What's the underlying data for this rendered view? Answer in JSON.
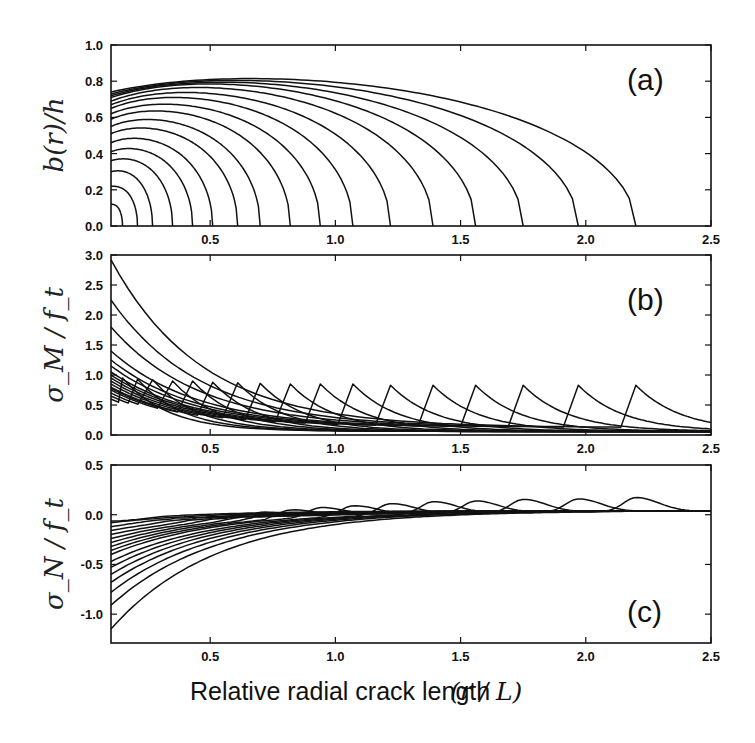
{
  "figure": {
    "xlabel": "Relative radial crack length",
    "xlabel_math": "(r / L)"
  },
  "chart_data": [
    {
      "id": "a",
      "type": "line",
      "panel_label": "(a)",
      "title": "",
      "xlabel": "Relative radial crack length (r/L)",
      "ylabel": "b(r)/h",
      "xlim": [
        0.104,
        2.5
      ],
      "ylim": [
        0.0,
        1.0
      ],
      "xticks": [
        0.5,
        1.0,
        1.5,
        2.0,
        2.5
      ],
      "yticks": [
        0.0,
        0.2,
        0.4,
        0.6,
        0.8,
        1.0
      ],
      "ytick_labels": [
        "0.0",
        "0.2",
        "0.4",
        "0.6",
        "0.8",
        "1.0"
      ],
      "grid": false,
      "legend": "none",
      "description": "Crack depth profiles b(r)/h for 17 successive radial crack lengths; each curve drops to zero at its crack tip.",
      "crack_tips": [
        0.15,
        0.21,
        0.27,
        0.35,
        0.43,
        0.51,
        0.61,
        0.7,
        0.82,
        0.94,
        1.07,
        1.22,
        1.39,
        1.56,
        1.75,
        1.97,
        2.2
      ],
      "start_values": [
        0.12,
        0.22,
        0.3,
        0.36,
        0.41,
        0.46,
        0.51,
        0.55,
        0.59,
        0.62,
        0.65,
        0.67,
        0.69,
        0.71,
        0.72,
        0.73,
        0.74
      ],
      "plateau_values": [
        0.12,
        0.22,
        0.31,
        0.38,
        0.44,
        0.5,
        0.56,
        0.61,
        0.66,
        0.7,
        0.74,
        0.77,
        0.8,
        0.82,
        0.83,
        0.84,
        0.85
      ]
    },
    {
      "id": "b",
      "type": "line",
      "panel_label": "(b)",
      "title": "",
      "xlabel": "Relative radial crack length (r/L)",
      "ylabel": "σ_M / f_t",
      "xlim": [
        0.104,
        2.5
      ],
      "ylim": [
        0.0,
        3.0
      ],
      "xticks": [
        0.5,
        1.0,
        1.5,
        2.0,
        2.5
      ],
      "yticks": [
        0.0,
        0.5,
        1.0,
        1.5,
        2.0,
        2.5,
        3.0
      ],
      "ytick_labels": [
        "0.0",
        "0.5",
        "1.0",
        "1.5",
        "2.0",
        "2.5",
        "3.0"
      ],
      "grid": false,
      "legend": "none",
      "description": "Normalized bending stress σ_M/f_t; each curve decays from the axis, peaks (~0.83–0.95) at its crack tip, then decays toward ~0.1.",
      "crack_tips": [
        0.15,
        0.21,
        0.27,
        0.35,
        0.43,
        0.51,
        0.61,
        0.7,
        0.82,
        0.94,
        1.07,
        1.22,
        1.39,
        1.56,
        1.75,
        1.97,
        2.2
      ],
      "start_values": [
        0.6,
        0.65,
        0.7,
        0.75,
        0.78,
        0.8,
        0.85,
        0.9,
        0.95,
        1.0,
        1.05,
        1.15,
        1.25,
        1.4,
        1.8,
        2.25,
        2.92
      ],
      "peak_values": [
        0.95,
        0.93,
        0.92,
        0.9,
        0.9,
        0.88,
        0.87,
        0.86,
        0.85,
        0.85,
        0.85,
        0.83,
        0.83,
        0.83,
        0.83,
        0.83,
        0.83
      ],
      "end_value_at_2.5": 0.1
    },
    {
      "id": "c",
      "type": "line",
      "panel_label": "(c)",
      "title": "",
      "xlabel": "Relative radial crack length (r/L)",
      "ylabel": "σ_N / f_t",
      "xlim": [
        0.104,
        2.5
      ],
      "ylim": [
        -1.29,
        0.5
      ],
      "xticks": [
        0.5,
        1.0,
        1.5,
        2.0,
        2.5
      ],
      "yticks": [
        -1.0,
        -0.5,
        0.0,
        0.5
      ],
      "ytick_labels": [
        "-1.0",
        "-0.5",
        "0.0",
        "0.5"
      ],
      "grid": false,
      "legend": "none",
      "description": "Normalized membrane stress σ_N/f_t; curves start negative at the axis, rise toward ~0.05, with small positive bumps at each crack tip.",
      "crack_tips": [
        0.15,
        0.21,
        0.27,
        0.35,
        0.43,
        0.51,
        0.61,
        0.7,
        0.82,
        0.94,
        1.07,
        1.22,
        1.39,
        1.56,
        1.75,
        1.97,
        2.2
      ],
      "start_values": [
        -0.05,
        -0.08,
        -0.12,
        -0.16,
        -0.2,
        -0.24,
        -0.28,
        -0.32,
        -0.36,
        -0.4,
        -0.47,
        -0.53,
        -0.6,
        -0.68,
        -0.78,
        -0.91,
        -1.15
      ],
      "bump_values": [
        0.02,
        0.04,
        0.06,
        0.07,
        0.08,
        0.09,
        0.1,
        0.11,
        0.12,
        0.13,
        0.14,
        0.15,
        0.16,
        0.16,
        0.17,
        0.17,
        0.18
      ],
      "asymptote": 0.04
    }
  ]
}
